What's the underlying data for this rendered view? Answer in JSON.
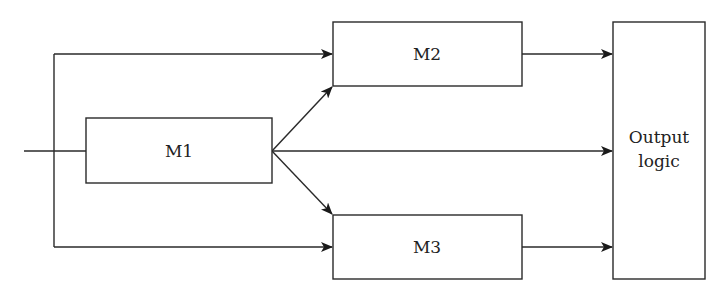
{
  "diagram": {
    "type": "block-diagram",
    "colors": {
      "stroke": "#2a2a2a",
      "text": "#222222",
      "background": "#ffffff"
    },
    "blocks": [
      {
        "id": "M1",
        "label": "M1"
      },
      {
        "id": "M2",
        "label": "M2"
      },
      {
        "id": "M3",
        "label": "M3"
      },
      {
        "id": "OUT",
        "label_line1": "Output",
        "label_line2": "logic"
      }
    ],
    "connections": [
      {
        "from": "input",
        "to": "M1"
      },
      {
        "from": "input",
        "to": "M2"
      },
      {
        "from": "input",
        "to": "M3"
      },
      {
        "from": "M1",
        "to": "M2"
      },
      {
        "from": "M1",
        "to": "M3"
      },
      {
        "from": "M1",
        "to": "OUT"
      },
      {
        "from": "M2",
        "to": "OUT"
      },
      {
        "from": "M3",
        "to": "OUT"
      }
    ]
  }
}
